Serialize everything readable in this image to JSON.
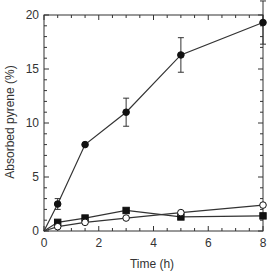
{
  "chart_data": {
    "type": "line",
    "title": "",
    "xlabel": "Time (h)",
    "ylabel": "Absorbed pyrene (%)",
    "xlim": [
      0,
      8
    ],
    "ylim": [
      0,
      20
    ],
    "xticks": [
      0,
      2,
      4,
      6,
      8
    ],
    "yticks": [
      0,
      5,
      10,
      15,
      20
    ],
    "x_minor_step": 0.5,
    "y_minor_step": 1,
    "grid": false,
    "legend": null,
    "series": [
      {
        "name": "series-filled-circle",
        "marker": "filled-circle",
        "x": [
          0,
          0.5,
          1.5,
          3,
          5,
          8
        ],
        "values": [
          0,
          2.5,
          8.0,
          11.0,
          16.3,
          19.3
        ],
        "errors": [
          0,
          0.5,
          0.2,
          1.3,
          1.6,
          2.0
        ]
      },
      {
        "name": "series-filled-square",
        "marker": "filled-square",
        "x": [
          0,
          0.5,
          1.5,
          3,
          5,
          8
        ],
        "values": [
          0,
          0.8,
          1.2,
          1.9,
          1.3,
          1.4
        ],
        "errors": [
          0,
          0,
          0,
          0,
          0,
          0
        ]
      },
      {
        "name": "series-open-circle",
        "marker": "open-circle",
        "x": [
          0,
          0.5,
          1.5,
          3,
          5,
          8
        ],
        "values": [
          0,
          0.4,
          0.8,
          1.2,
          1.7,
          2.4
        ],
        "errors": [
          0,
          0,
          0,
          0,
          0,
          0
        ]
      }
    ]
  },
  "axes": {
    "xlabel": "Time (h)",
    "ylabel": "Absorbed pyrene (%)",
    "xtick_labels": [
      "0",
      "2",
      "4",
      "6",
      "8"
    ],
    "ytick_labels": [
      "0",
      "5",
      "10",
      "15",
      "20"
    ]
  }
}
